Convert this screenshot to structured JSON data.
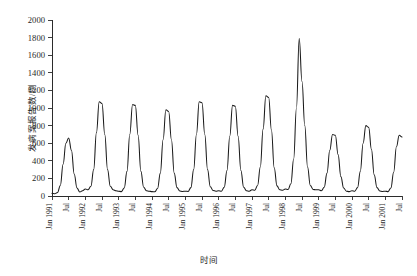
{
  "chart_data": {
    "type": "line",
    "title": "",
    "xlabel": "时间",
    "ylabel": "发病案报告数/例",
    "ylim": [
      0,
      2000
    ],
    "ytick_step": 200,
    "yticks": [
      0,
      200,
      400,
      600,
      800,
      1000,
      1200,
      1400,
      1600,
      1800,
      2000
    ],
    "grid": false,
    "legend": "none",
    "line_color": "#1a1a1a",
    "x_start": "Jan 1991",
    "x_end": "Jul 2001",
    "xtick_labels": [
      "Jan 1991",
      "Jul",
      "Jan 1992",
      "Jul",
      "Jan 1993",
      "Jul",
      "Jan 1994",
      "Jul",
      "Jan 1995",
      "Jul",
      "Jan 1996",
      "Jul",
      "Jan 1997",
      "Jul",
      "Jan 1998",
      "Jul",
      "Jan 1999",
      "Jul",
      "Jan 2000",
      "Jul",
      "Jan 2001",
      "Jul"
    ],
    "x": [
      "1991-01",
      "1991-02",
      "1991-03",
      "1991-04",
      "1991-05",
      "1991-06",
      "1991-07",
      "1991-08",
      "1991-09",
      "1991-10",
      "1991-11",
      "1991-12",
      "1992-01",
      "1992-02",
      "1992-03",
      "1992-04",
      "1992-05",
      "1992-06",
      "1992-07",
      "1992-08",
      "1992-09",
      "1992-10",
      "1992-11",
      "1992-12",
      "1993-01",
      "1993-02",
      "1993-03",
      "1993-04",
      "1993-05",
      "1993-06",
      "1993-07",
      "1993-08",
      "1993-09",
      "1993-10",
      "1993-11",
      "1993-12",
      "1994-01",
      "1994-02",
      "1994-03",
      "1994-04",
      "1994-05",
      "1994-06",
      "1994-07",
      "1994-08",
      "1994-09",
      "1994-10",
      "1994-11",
      "1994-12",
      "1995-01",
      "1995-02",
      "1995-03",
      "1995-04",
      "1995-05",
      "1995-06",
      "1995-07",
      "1995-08",
      "1995-09",
      "1995-10",
      "1995-11",
      "1995-12",
      "1996-01",
      "1996-02",
      "1996-03",
      "1996-04",
      "1996-05",
      "1996-06",
      "1996-07",
      "1996-08",
      "1996-09",
      "1996-10",
      "1996-11",
      "1996-12",
      "1997-01",
      "1997-02",
      "1997-03",
      "1997-04",
      "1997-05",
      "1997-06",
      "1997-07",
      "1997-08",
      "1997-09",
      "1997-10",
      "1997-11",
      "1997-12",
      "1998-01",
      "1998-02",
      "1998-03",
      "1998-04",
      "1998-05",
      "1998-06",
      "1998-07",
      "1998-08",
      "1998-09",
      "1998-10",
      "1998-11",
      "1998-12",
      "1999-01",
      "1999-02",
      "1999-03",
      "1999-04",
      "1999-05",
      "1999-06",
      "1999-07",
      "1999-08",
      "1999-09",
      "1999-10",
      "1999-11",
      "1999-12",
      "2000-01",
      "2000-02",
      "2000-03",
      "2000-04",
      "2000-05",
      "2000-06",
      "2000-07",
      "2000-08",
      "2000-09",
      "2000-10",
      "2000-11",
      "2000-12",
      "2001-01",
      "2001-02",
      "2001-03",
      "2001-04",
      "2001-05",
      "2001-06",
      "2001-07"
    ],
    "values": [
      30,
      25,
      40,
      120,
      360,
      600,
      660,
      520,
      250,
      90,
      45,
      60,
      80,
      70,
      110,
      300,
      720,
      1070,
      1050,
      700,
      300,
      110,
      70,
      60,
      55,
      50,
      90,
      280,
      700,
      1040,
      1030,
      690,
      280,
      100,
      60,
      55,
      50,
      48,
      85,
      260,
      640,
      980,
      960,
      640,
      260,
      95,
      58,
      52,
      55,
      52,
      95,
      300,
      700,
      1070,
      1060,
      700,
      300,
      105,
      62,
      55,
      60,
      55,
      100,
      290,
      680,
      1030,
      1020,
      680,
      290,
      100,
      60,
      55,
      70,
      65,
      120,
      330,
      760,
      1140,
      1120,
      750,
      320,
      115,
      70,
      65,
      80,
      75,
      140,
      420,
      1000,
      1790,
      1300,
      800,
      330,
      120,
      75,
      70,
      70,
      60,
      100,
      260,
      520,
      700,
      690,
      470,
      220,
      90,
      55,
      50,
      60,
      55,
      95,
      280,
      600,
      800,
      780,
      530,
      240,
      95,
      58,
      52,
      55,
      50,
      90,
      270,
      560,
      690,
      670
    ]
  }
}
